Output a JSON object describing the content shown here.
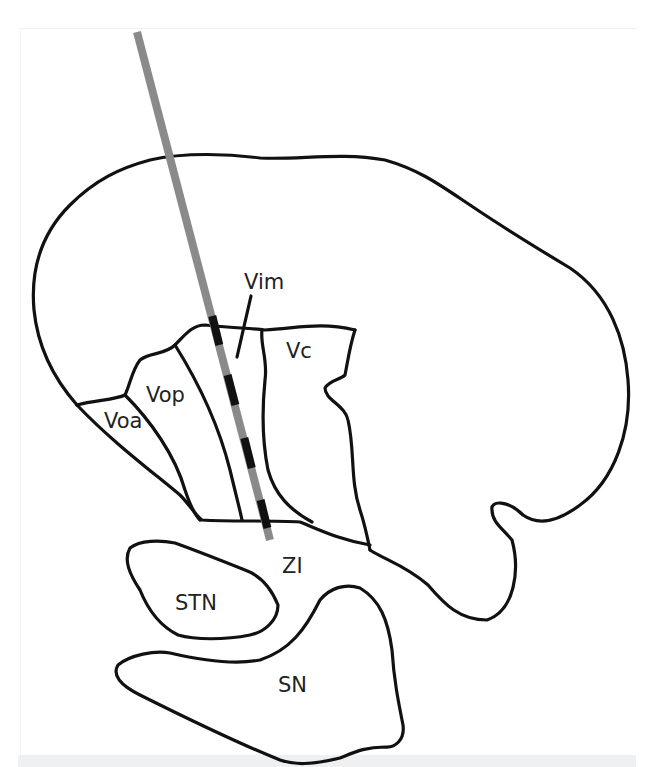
{
  "figure": {
    "type": "anatomical-diagram",
    "colors": {
      "outline": "#111111",
      "electrode_shaft": "#8a8a8a",
      "electrode_contact": "#111111",
      "background": "#ffffff",
      "bottom_band": "#eef0f1"
    }
  },
  "labels": {
    "vim": "Vim",
    "vc": "Vc",
    "vop": "Vop",
    "voa": "Voa",
    "zi": "ZI",
    "stn": "STN",
    "sn": "SN"
  },
  "electrode": {
    "start": [
      137,
      32
    ],
    "end": [
      270,
      540
    ],
    "contacts_count": 4
  }
}
